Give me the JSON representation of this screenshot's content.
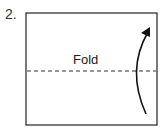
{
  "step": {
    "number_label": "2."
  },
  "diagram": {
    "fold_label": "Fold",
    "paper": {
      "stroke": "#333333"
    },
    "fold_line": {
      "style": "dashed",
      "stroke": "#333333"
    },
    "arrow": {
      "direction": "up",
      "description": "curved arrow indicating folding bottom half upward"
    }
  }
}
